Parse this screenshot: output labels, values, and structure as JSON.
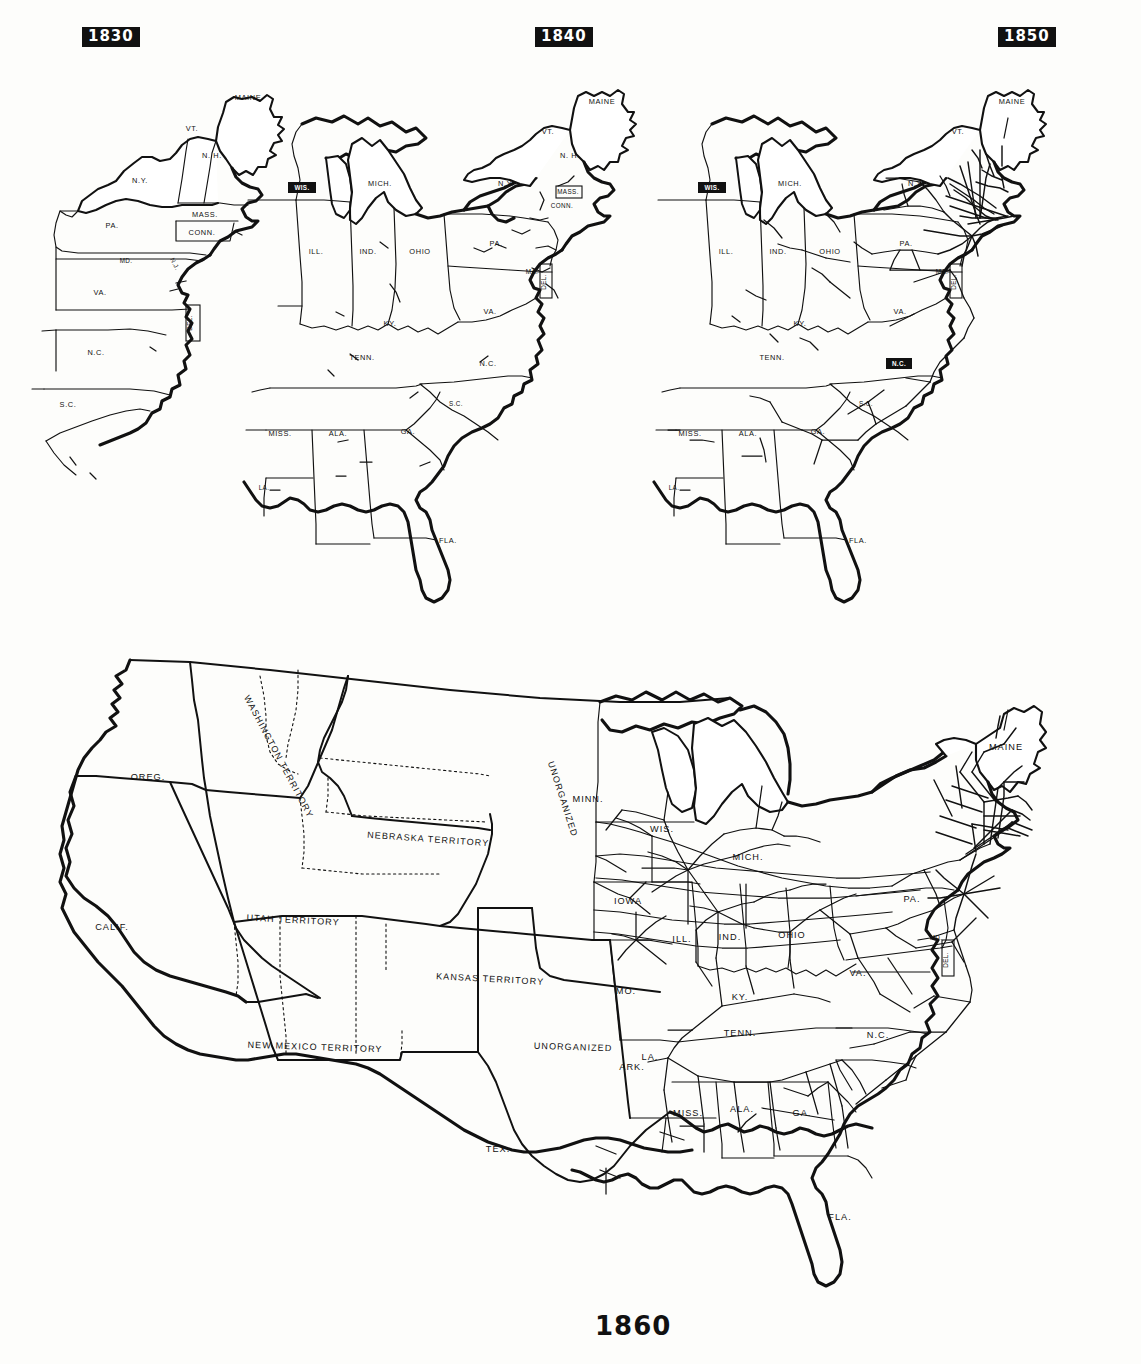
{
  "document": {
    "kind": "historical-map-series",
    "subject": "Growth of railroads in the United States",
    "panel_count": 4
  },
  "panels": [
    {
      "id": "map-1830",
      "year_label": "1830",
      "label_style": "white-on-black-box",
      "region": "Northeastern United States",
      "rail_density": "very sparse — a few short lines near Baltimore, Charleston and Boston",
      "state_labels": [
        "MAINE",
        "VT.",
        "N. H.",
        "MASS.",
        "CONN.",
        "N.Y.",
        "PA.",
        "N.J.",
        "MD.",
        "DEL.",
        "VA.",
        "N.C.",
        "S.C."
      ]
    },
    {
      "id": "map-1840",
      "year_label": "1840",
      "label_style": "white-on-black-box",
      "region": "Eastern United States",
      "rail_density": "sparse — scattered short lines in the Northeast and South",
      "state_labels": [
        "MAINE",
        "VT.",
        "N. H.",
        "MASS.",
        "CONN.",
        "N.Y.",
        "PA.",
        "N.J.",
        "MD.",
        "DEL.",
        "VA.",
        "N.C.",
        "S.C.",
        "GA.",
        "FLA.",
        "ALA.",
        "MISS.",
        "LA.",
        "TENN.",
        "KY.",
        "OHIO",
        "IND.",
        "ILL.",
        "MICH.",
        "WIS."
      ],
      "highlighted_labels": [
        "WIS."
      ]
    },
    {
      "id": "map-1850",
      "year_label": "1850",
      "label_style": "white-on-black-box",
      "region": "Eastern United States",
      "rail_density": "heavy in New England and the Middle Atlantic; growing in the Ohio Valley and South",
      "state_labels": [
        "MAINE",
        "VT.",
        "MASS.",
        "N.Y.",
        "PA.",
        "MD.",
        "DEL.",
        "VA.",
        "N.C.",
        "S.C.",
        "GA.",
        "FLA.",
        "ALA.",
        "MISS.",
        "LA.",
        "TENN.",
        "KY.",
        "OHIO",
        "IND.",
        "ILL.",
        "MICH.",
        "WIS."
      ],
      "highlighted_labels": [
        "WIS.",
        "N.C."
      ]
    },
    {
      "id": "map-1860",
      "year_label": "1860",
      "label_style": "plain-black-text-below-map",
      "region": "United States and western territories",
      "rail_density": "dense network east of the Mississippi; none in the western territories",
      "state_labels": [
        "OREG.",
        "CALIF.",
        "MINN.",
        "IOWA",
        "MO.",
        "ARK.",
        "TEX.",
        "WIS.",
        "MICH.",
        "ILL.",
        "IND.",
        "OHIO",
        "KY.",
        "TENN.",
        "MISS.",
        "ALA.",
        "GA.",
        "FLA.",
        "N.C.",
        "VA.",
        "PA.",
        "MD.",
        "DEL.",
        "MAINE"
      ],
      "territory_labels": [
        "WASHINGTON TERRITORY",
        "NEBRASKA TERRITORY",
        "UTAH TERRITORY",
        "KANSAS TERRITORY",
        "NEW MEXICO TERRITORY",
        "UNORGANIZED",
        "UNORGANIZED"
      ]
    }
  ],
  "labels": {
    "maine": "MAINE",
    "vt": "VT.",
    "nh": "N. H.",
    "mass": "MASS.",
    "conn": "CONN.",
    "ny": "N.Y.",
    "pa": "PA.",
    "nj": "N.J.",
    "md": "MD.",
    "del": "DEL.",
    "va": "VA.",
    "nc": "N.C.",
    "sc": "S.C.",
    "ga": "GA.",
    "fla": "FLA.",
    "ala": "ALA.",
    "miss": "MISS.",
    "la": "LA.",
    "tenn": "TENN.",
    "ky": "KY.",
    "ohio": "OHIO",
    "ind": "IND.",
    "ill": "ILL.",
    "mich": "MICH.",
    "wis": "WIS.",
    "minn": "MINN.",
    "iowa": "IOWA",
    "mo": "MO.",
    "ark": "ARK.",
    "tex": "TEX.",
    "calif": "CALIF.",
    "oreg": "OREG.",
    "ma_short": "MA.",
    "washington_terr": "WASHINGTON TERRITORY",
    "nebraska_terr": "NEBRASKA TERRITORY",
    "utah_terr": "UTAH TERRITORY",
    "kansas_terr": "KANSAS TERRITORY",
    "newmexico_terr": "NEW MEXICO TERRITORY",
    "unorganized": "UNORGANIZED"
  },
  "years": {
    "y1830": "1830",
    "y1840": "1840",
    "y1850": "1850",
    "y1860": "1860"
  },
  "colors": {
    "ink": "#111111",
    "paper": "#fdfdfb",
    "badge_bg": "#111111",
    "badge_text": "#ffffff"
  }
}
